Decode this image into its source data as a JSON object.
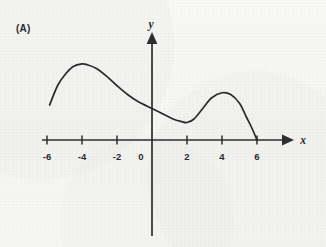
{
  "figure": {
    "panel_label": "(A)",
    "background_color": "#f7f7f6",
    "ink_color": "#2b2b2b"
  },
  "chart_data": {
    "type": "line",
    "title": "",
    "subtitle": "",
    "xlabel": "x",
    "ylabel": "y",
    "grid": false,
    "legend": null,
    "annotations": [
      "(A)"
    ],
    "axis_style": "arrowed-cartesian-axes",
    "xlim": [
      -7,
      7.6
    ],
    "ylim": [
      -5.4,
      6.2
    ],
    "xticks": [
      -6,
      -4,
      -2,
      0,
      2,
      4,
      6
    ],
    "xtick_labels": [
      "-6",
      "-4",
      "-2",
      "0",
      "2",
      "4",
      "6"
    ],
    "yticks": [],
    "ytick_labels": [],
    "series": [
      {
        "name": "curve",
        "x": [
          -5.85,
          -5.4,
          -5.0,
          -4.5,
          -4.0,
          -3.7,
          -3.2,
          -2.6,
          -2.0,
          -1.4,
          -0.8,
          0.0,
          0.6,
          1.2,
          1.7,
          2.0,
          2.4,
          2.9,
          3.4,
          4.0,
          4.5,
          5.0,
          5.4,
          5.7,
          6.0
        ],
        "y": [
          2.0,
          3.1,
          3.7,
          4.2,
          4.35,
          4.3,
          4.1,
          3.65,
          3.1,
          2.6,
          2.2,
          1.8,
          1.5,
          1.2,
          1.05,
          1.0,
          1.2,
          1.8,
          2.4,
          2.7,
          2.6,
          2.1,
          1.3,
          0.7,
          0.0
        ]
      }
    ],
    "features": {
      "left_local_maximum": [
        -3.7,
        4.35
      ],
      "y_intercept": [
        0,
        1.8
      ],
      "local_minimum": [
        2.0,
        1.0
      ],
      "right_local_maximum": [
        4.0,
        2.7
      ],
      "left_endpoint": [
        -5.85,
        2.0
      ],
      "right_endpoint_x_intercept": [
        6.0,
        0.0
      ]
    }
  }
}
